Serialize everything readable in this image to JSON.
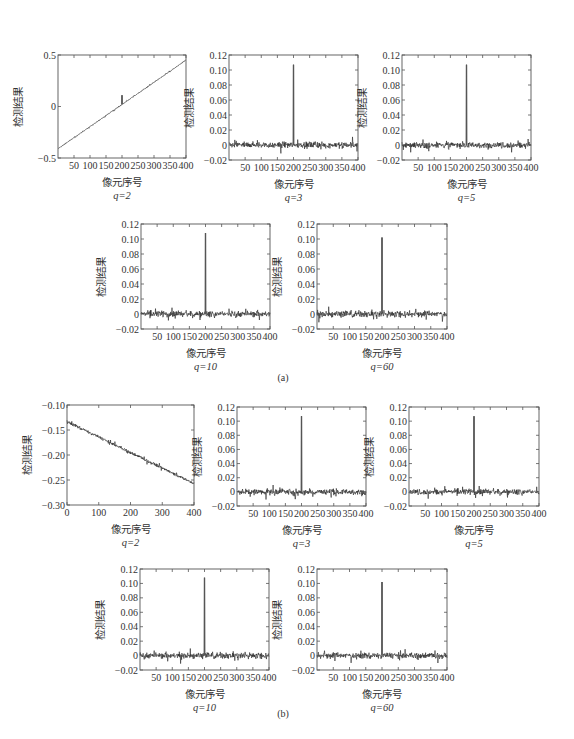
{
  "figure": {
    "panels": [
      {
        "label": "(a)"
      },
      {
        "label": "(b)"
      }
    ]
  },
  "chart_data": [
    {
      "panel": "(a)",
      "type": "line",
      "q_label": "q=2",
      "xlabel": "像元序号",
      "ylabel": "检测结果",
      "xlim": [
        0,
        400
      ],
      "ylim": [
        -0.5,
        0.5
      ],
      "xticks": [
        50,
        100,
        150,
        200,
        250,
        300,
        350,
        400
      ],
      "xtick_labels": [
        "50",
        "100",
        "150",
        "200",
        "250",
        "300",
        "350",
        "400"
      ],
      "yticks": [
        -0.5,
        0,
        0.5
      ],
      "ytick_labels": [
        "−0.5",
        "0",
        "0.5"
      ],
      "trend": {
        "start": -0.41,
        "end": 0.45
      },
      "noise": 0.004,
      "peak": {
        "x": 200,
        "height": 0.09
      }
    },
    {
      "panel": "(a)",
      "type": "line",
      "q_label": "q=3",
      "xlabel": "像元序号",
      "ylabel": "检测结果",
      "xlim": [
        0,
        400
      ],
      "ylim": [
        -0.02,
        0.12
      ],
      "xticks": [
        50,
        100,
        150,
        200,
        250,
        300,
        350,
        400
      ],
      "xtick_labels": [
        "50",
        "100",
        "150",
        "200",
        "250",
        "300",
        "350",
        "400"
      ],
      "yticks": [
        -0.02,
        0,
        0.02,
        0.04,
        0.06,
        0.08,
        0.1,
        0.12
      ],
      "ytick_labels": [
        "−0.02",
        "0",
        "0.02",
        "0.04",
        "0.06",
        "0.08",
        "0.10",
        "0.12"
      ],
      "trend": {
        "start": 0,
        "end": 0
      },
      "noise": 0.004,
      "peak": {
        "x": 200,
        "height": 0.107
      }
    },
    {
      "panel": "(a)",
      "type": "line",
      "q_label": "q=5",
      "xlabel": "像元序号",
      "ylabel": "检测结果",
      "xlim": [
        0,
        400
      ],
      "ylim": [
        -0.02,
        0.12
      ],
      "xticks": [
        50,
        100,
        150,
        200,
        250,
        300,
        350,
        400
      ],
      "xtick_labels": [
        "50",
        "100",
        "150",
        "200",
        "250",
        "300",
        "350",
        "400"
      ],
      "yticks": [
        -0.02,
        0,
        0.02,
        0.04,
        0.06,
        0.08,
        0.1,
        0.12
      ],
      "ytick_labels": [
        "−0.02",
        "0",
        "0.02",
        "0.04",
        "0.06",
        "0.08",
        "0.10",
        "0.12"
      ],
      "trend": {
        "start": 0,
        "end": 0
      },
      "noise": 0.004,
      "peak": {
        "x": 200,
        "height": 0.107
      }
    },
    {
      "panel": "(a)",
      "type": "line",
      "q_label": "q=10",
      "xlabel": "像元序号",
      "ylabel": "检测结果",
      "xlim": [
        0,
        400
      ],
      "ylim": [
        -0.02,
        0.12
      ],
      "xticks": [
        50,
        100,
        150,
        200,
        250,
        300,
        350,
        400
      ],
      "xtick_labels": [
        "50",
        "100",
        "150",
        "200",
        "250",
        "300",
        "350",
        "400"
      ],
      "yticks": [
        -0.02,
        0,
        0.02,
        0.04,
        0.06,
        0.08,
        0.1,
        0.12
      ],
      "ytick_labels": [
        "−0.02",
        "0",
        "0.02",
        "0.04",
        "0.06",
        "0.08",
        "0.10",
        "0.12"
      ],
      "trend": {
        "start": 0,
        "end": 0
      },
      "noise": 0.004,
      "peak": {
        "x": 200,
        "height": 0.108
      }
    },
    {
      "panel": "(a)",
      "type": "line",
      "q_label": "q=60",
      "xlabel": "像元序号",
      "ylabel": "检测结果",
      "xlim": [
        0,
        400
      ],
      "ylim": [
        -0.02,
        0.12
      ],
      "xticks": [
        50,
        100,
        150,
        200,
        250,
        300,
        350,
        400
      ],
      "xtick_labels": [
        "50",
        "100",
        "150",
        "200",
        "250",
        "300",
        "350",
        "400"
      ],
      "yticks": [
        -0.02,
        0,
        0.02,
        0.04,
        0.06,
        0.08,
        0.1,
        0.12
      ],
      "ytick_labels": [
        "−0.02",
        "0",
        "0.02",
        "0.04",
        "0.06",
        "0.08",
        "0.10",
        "0.12"
      ],
      "trend": {
        "start": 0,
        "end": 0
      },
      "noise": 0.004,
      "peak": {
        "x": 200,
        "height": 0.102
      }
    },
    {
      "panel": "(b)",
      "type": "line",
      "q_label": "q=2",
      "xlabel": "像元序号",
      "ylabel": "检测结果",
      "xlim": [
        0,
        400
      ],
      "ylim": [
        -0.3,
        -0.1
      ],
      "xticks": [
        0,
        100,
        200,
        300,
        400
      ],
      "xtick_labels": [
        "0",
        "100",
        "200",
        "300",
        "400"
      ],
      "yticks": [
        -0.3,
        -0.25,
        -0.2,
        -0.15,
        -0.1
      ],
      "ytick_labels": [
        "−0.30",
        "−0.25",
        "−0.20",
        "−0.15",
        "−0.10"
      ],
      "trend": {
        "start": -0.133,
        "end": -0.257
      },
      "noise": 0.003,
      "peak": null
    },
    {
      "panel": "(b)",
      "type": "line",
      "q_label": "q=3",
      "xlabel": "像元序号",
      "ylabel": "检测结果",
      "xlim": [
        0,
        400
      ],
      "ylim": [
        -0.02,
        0.12
      ],
      "xticks": [
        50,
        100,
        150,
        200,
        250,
        300,
        350,
        400
      ],
      "xtick_labels": [
        "50",
        "100",
        "150",
        "200",
        "250",
        "300",
        "350",
        "400"
      ],
      "yticks": [
        -0.02,
        0,
        0.02,
        0.04,
        0.06,
        0.08,
        0.1,
        0.12
      ],
      "ytick_labels": [
        "−0.02",
        "0",
        "0.02",
        "0.04",
        "0.06",
        "0.08",
        "0.10",
        "0.12"
      ],
      "trend": {
        "start": 0,
        "end": 0
      },
      "noise": 0.004,
      "peak": {
        "x": 200,
        "height": 0.107
      }
    },
    {
      "panel": "(b)",
      "type": "line",
      "q_label": "q=5",
      "xlabel": "像元序号",
      "ylabel": "检测结果",
      "xlim": [
        0,
        400
      ],
      "ylim": [
        -0.02,
        0.12
      ],
      "xticks": [
        50,
        100,
        150,
        200,
        250,
        300,
        350,
        400
      ],
      "xtick_labels": [
        "50",
        "100",
        "150",
        "200",
        "250",
        "300",
        "350",
        "400"
      ],
      "yticks": [
        -0.02,
        0,
        0.02,
        0.04,
        0.06,
        0.08,
        0.1,
        0.12
      ],
      "ytick_labels": [
        "−0.02",
        "0",
        "0.02",
        "0.04",
        "0.06",
        "0.08",
        "0.10",
        "0.12"
      ],
      "trend": {
        "start": 0,
        "end": 0
      },
      "noise": 0.004,
      "peak": {
        "x": 200,
        "height": 0.107
      }
    },
    {
      "panel": "(b)",
      "type": "line",
      "q_label": "q=10",
      "xlabel": "像元序号",
      "ylabel": "检测结果",
      "xlim": [
        0,
        400
      ],
      "ylim": [
        -0.02,
        0.12
      ],
      "xticks": [
        50,
        100,
        150,
        200,
        250,
        300,
        350,
        400
      ],
      "xtick_labels": [
        "50",
        "100",
        "150",
        "200",
        "250",
        "300",
        "350",
        "400"
      ],
      "yticks": [
        -0.02,
        0,
        0.02,
        0.04,
        0.06,
        0.08,
        0.1,
        0.12
      ],
      "ytick_labels": [
        "−0.02",
        "0",
        "0.02",
        "0.04",
        "0.06",
        "0.08",
        "0.10",
        "0.12"
      ],
      "trend": {
        "start": 0,
        "end": 0
      },
      "noise": 0.004,
      "peak": {
        "x": 200,
        "height": 0.108
      }
    },
    {
      "panel": "(b)",
      "type": "line",
      "q_label": "q=60",
      "xlabel": "像元序号",
      "ylabel": "检测结果",
      "xlim": [
        0,
        400
      ],
      "ylim": [
        -0.02,
        0.12
      ],
      "xticks": [
        50,
        100,
        150,
        200,
        250,
        300,
        350,
        400
      ],
      "xtick_labels": [
        "50",
        "100",
        "150",
        "200",
        "250",
        "300",
        "350",
        "400"
      ],
      "yticks": [
        -0.02,
        0,
        0.02,
        0.04,
        0.06,
        0.08,
        0.1,
        0.12
      ],
      "ytick_labels": [
        "−0.02",
        "0",
        "0.02",
        "0.04",
        "0.06",
        "0.08",
        "0.10",
        "0.12"
      ],
      "trend": {
        "start": 0,
        "end": 0
      },
      "noise": 0.004,
      "peak": {
        "x": 200,
        "height": 0.102
      }
    }
  ]
}
